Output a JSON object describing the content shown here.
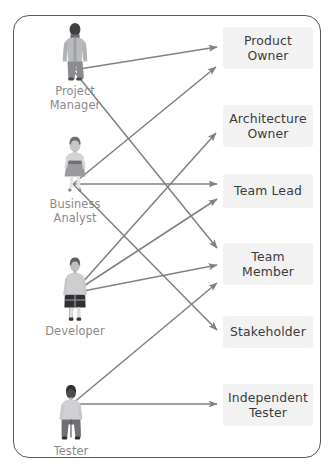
{
  "diagram": {
    "canvas": {
      "width": 334,
      "height": 474
    },
    "frame": {
      "x": 13,
      "y": 15,
      "width": 308,
      "height": 443,
      "radius": 16,
      "border_color": "#58595b"
    },
    "colors": {
      "arrow": "#7f8083",
      "role_box_bg": "#f2f2f2",
      "role_text": "#3b3b3d",
      "actor_text": "#8a8a8d",
      "frame_border": "#58595b",
      "figure_dark": "#3f4044",
      "figure_light": "#c9c9cb",
      "figure_mid": "#9b9c9e"
    }
  },
  "actors": [
    {
      "id": "project-manager",
      "label": "Project\nManager",
      "icon": "person-male-suit-icon",
      "x": 29,
      "y": 21,
      "origin": {
        "x": 73,
        "y": 70
      }
    },
    {
      "id": "business-analyst",
      "label": "Business\nAnalyst",
      "icon": "person-female-dress-icon",
      "x": 29,
      "y": 136,
      "origin": {
        "x": 73,
        "y": 184
      }
    },
    {
      "id": "developer",
      "label": "Developer",
      "icon": "person-female-casual-icon",
      "x": 29,
      "y": 257,
      "origin": {
        "x": 73,
        "y": 293
      }
    },
    {
      "id": "tester",
      "label": "Tester",
      "icon": "person-male-casual-icon",
      "x": 25,
      "y": 385,
      "origin": {
        "x": 72,
        "y": 404
      }
    }
  ],
  "roles": [
    {
      "id": "product-owner",
      "label": "Product\nOwner",
      "x": 223,
      "y": 27,
      "width": 90,
      "height": 42
    },
    {
      "id": "architecture-owner",
      "label": "Architecture\nOwner",
      "x": 223,
      "y": 105,
      "width": 90,
      "height": 42
    },
    {
      "id": "team-lead",
      "label": "Team Lead",
      "x": 223,
      "y": 174,
      "width": 90,
      "height": 34
    },
    {
      "id": "team-member",
      "label": "Team\nMember",
      "x": 223,
      "y": 243,
      "width": 90,
      "height": 42
    },
    {
      "id": "stakeholder",
      "label": "Stakeholder",
      "x": 223,
      "y": 316,
      "width": 90,
      "height": 32
    },
    {
      "id": "independent-tester",
      "label": "Independent\nTester",
      "x": 223,
      "y": 384,
      "width": 90,
      "height": 42
    }
  ],
  "connections": [
    {
      "id": "pm-to-product-owner",
      "from": "project-manager",
      "to": "product-owner",
      "x1": 73,
      "y1": 70,
      "x2": 217,
      "y2": 47
    },
    {
      "id": "pm-to-team-member",
      "from": "project-manager",
      "to": "team-member",
      "x1": 73,
      "y1": 70,
      "x2": 217,
      "y2": 248
    },
    {
      "id": "ba-to-product-owner",
      "from": "business-analyst",
      "to": "product-owner",
      "x1": 73,
      "y1": 184,
      "x2": 216,
      "y2": 67
    },
    {
      "id": "ba-to-team-lead",
      "from": "business-analyst",
      "to": "team-lead",
      "x1": 73,
      "y1": 184,
      "x2": 217,
      "y2": 184
    },
    {
      "id": "ba-to-stakeholder",
      "from": "business-analyst",
      "to": "stakeholder",
      "x1": 73,
      "y1": 184,
      "x2": 217,
      "y2": 330
    },
    {
      "id": "dev-to-architecture-owner",
      "from": "developer",
      "to": "architecture-owner",
      "x1": 73,
      "y1": 293,
      "x2": 216,
      "y2": 133
    },
    {
      "id": "dev-to-team-lead",
      "from": "developer",
      "to": "team-lead",
      "x1": 73,
      "y1": 293,
      "x2": 217,
      "y2": 199
    },
    {
      "id": "dev-to-team-member",
      "from": "developer",
      "to": "team-member",
      "x1": 73,
      "y1": 293,
      "x2": 217,
      "y2": 265
    },
    {
      "id": "tester-to-team-member",
      "from": "tester",
      "to": "team-member",
      "x1": 72,
      "y1": 404,
      "x2": 217,
      "y2": 283
    },
    {
      "id": "tester-to-independent",
      "from": "tester",
      "to": "independent-tester",
      "x1": 72,
      "y1": 404,
      "x2": 217,
      "y2": 404
    }
  ]
}
